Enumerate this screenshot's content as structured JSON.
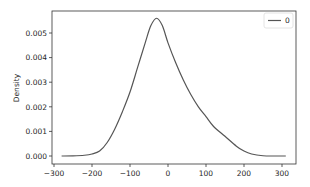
{
  "chart_data": {
    "type": "line",
    "title": "",
    "xlabel": "",
    "ylabel": "Density",
    "xlim": [
      -310,
      340
    ],
    "ylim": [
      -0.0003,
      0.0058
    ],
    "grid": false,
    "legend_position": "upper right",
    "x_ticks": [
      -300,
      -200,
      -100,
      0,
      100,
      200,
      300
    ],
    "x_tick_labels": [
      "−300",
      "−200",
      "−100",
      "0",
      "100",
      "200",
      "300"
    ],
    "y_ticks": [
      0.0,
      0.001,
      0.002,
      0.003,
      0.004,
      0.005
    ],
    "y_tick_labels": [
      "0.000",
      "0.001",
      "0.002",
      "0.003",
      "0.004",
      "0.005"
    ],
    "series": [
      {
        "name": "0",
        "color": "#555555",
        "x": [
          -280,
          -250,
          -220,
          -200,
          -180,
          -160,
          -140,
          -120,
          -100,
          -80,
          -60,
          -45,
          -30,
          -15,
          0,
          20,
          40,
          60,
          80,
          100,
          120,
          150,
          180,
          200,
          220,
          250,
          280,
          310
        ],
        "y": [
          0.0,
          5e-06,
          3e-05,
          8e-05,
          0.0002,
          0.00055,
          0.0011,
          0.0018,
          0.0026,
          0.0036,
          0.0046,
          0.0053,
          0.0056,
          0.0053,
          0.0046,
          0.0038,
          0.0031,
          0.0025,
          0.002,
          0.0016,
          0.0012,
          0.0008,
          0.0004,
          0.0002,
          8e-05,
          1e-05,
          0.0,
          0.0
        ]
      }
    ],
    "legend": [
      "0"
    ]
  },
  "layout": {
    "plot_left": 52,
    "plot_right": 296,
    "plot_top": 11,
    "plot_bottom": 164,
    "x_px_per_unit": 0.38,
    "x_zero_px": 168,
    "y_zero_px": 156,
    "y_px_per_unit": 24600
  }
}
